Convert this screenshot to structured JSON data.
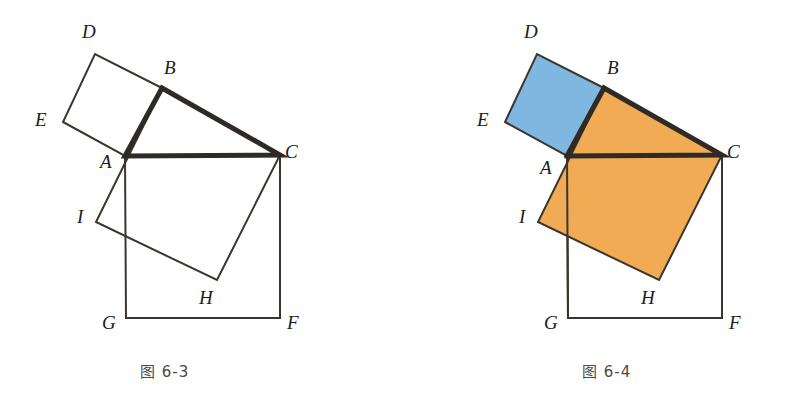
{
  "page": {
    "background_color": "#ffffff",
    "width": 793,
    "height": 411
  },
  "colors": {
    "stroke": "#3a352f",
    "stroke_bold": "#2f2a26",
    "square_on_leg_ab_fill": "#7fb7e0",
    "square_on_leg_bc_fill": "#f0ab54",
    "square_on_hypotenuse_fill": "#f0ab54",
    "unfilled": "#ffffff",
    "caption_color": "#4a4a42",
    "label_color": "#1b1b1b"
  },
  "figures": [
    {
      "id": "fig-6-3",
      "caption": "图 6-3",
      "caption_x": 140,
      "caption_y": 360,
      "filled": false,
      "origin_x": 0,
      "vertices": {
        "A": {
          "x": 125,
          "y": 156,
          "label": "A",
          "label_x": 100,
          "label_y": 152
        },
        "B": {
          "x": 162,
          "y": 88,
          "label": "B",
          "label_x": 164,
          "label_y": 58
        },
        "C": {
          "x": 280,
          "y": 155,
          "label": "C",
          "label_x": 285,
          "label_y": 142
        },
        "D": {
          "x": 95,
          "y": 54,
          "label": "D",
          "label_x": 82,
          "label_y": 22
        },
        "E": {
          "x": 63,
          "y": 122,
          "label": "E",
          "label_x": 35,
          "label_y": 110
        },
        "F": {
          "x": 280,
          "y": 318,
          "label": "F",
          "label_x": 287,
          "label_y": 313
        },
        "G": {
          "x": 126,
          "y": 318,
          "label": "G",
          "label_x": 102,
          "label_y": 313
        },
        "H": {
          "x": 217,
          "y": 280,
          "label": "H",
          "label_x": 199,
          "label_y": 288
        },
        "I": {
          "x": 96,
          "y": 222,
          "label": "I",
          "label_x": 77,
          "label_y": 207
        }
      }
    },
    {
      "id": "fig-6-4",
      "caption": "图 6-4",
      "caption_x": 582,
      "caption_y": 360,
      "filled": true,
      "origin_x": 442,
      "vertices": {
        "A": {
          "x": 567,
          "y": 156,
          "label": "A",
          "label_x": 540,
          "label_y": 158
        },
        "B": {
          "x": 604,
          "y": 88,
          "label": "B",
          "label_x": 607,
          "label_y": 58
        },
        "C": {
          "x": 722,
          "y": 155,
          "label": "C",
          "label_x": 727,
          "label_y": 142
        },
        "D": {
          "x": 537,
          "y": 54,
          "label": "D",
          "label_x": 524,
          "label_y": 22
        },
        "E": {
          "x": 505,
          "y": 122,
          "label": "E",
          "label_x": 477,
          "label_y": 110
        },
        "F": {
          "x": 722,
          "y": 318,
          "label": "F",
          "label_x": 729,
          "label_y": 313
        },
        "G": {
          "x": 568,
          "y": 318,
          "label": "G",
          "label_x": 544,
          "label_y": 313
        },
        "H": {
          "x": 659,
          "y": 280,
          "label": "H",
          "label_x": 641,
          "label_y": 288
        },
        "I": {
          "x": 538,
          "y": 222,
          "label": "I",
          "label_x": 519,
          "label_y": 207
        }
      }
    }
  ],
  "shapes": {
    "square_abde": {
      "name": "square on leg AB",
      "points": "A,B,D,E"
    },
    "square_bchi": {
      "name": "square on leg BC",
      "points": "B,C,H,I"
    },
    "square_acfg": {
      "name": "square on hypotenuse AC",
      "points": "A,C,F,G"
    },
    "triangle_abc": {
      "name": "right triangle ABC",
      "points": "A,B,C"
    }
  }
}
